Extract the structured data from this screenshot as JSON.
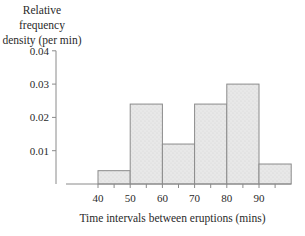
{
  "chart_data": {
    "type": "bar",
    "subtype": "histogram",
    "title": "",
    "ylabel": "Relative frequency density (per min)",
    "ylabel_lines": [
      "Relative frequency",
      "density (per min)"
    ],
    "xlabel": "Time intervals between eruptions (mins)",
    "ylim": [
      0,
      0.04
    ],
    "y_ticks": [
      "0.01",
      "0.02",
      "0.03",
      "0.04"
    ],
    "y_tick_values": [
      0.01,
      0.02,
      0.03,
      0.04
    ],
    "x_ticks": [
      "40",
      "50",
      "60",
      "70",
      "80",
      "90"
    ],
    "x_tick_values": [
      40,
      50,
      60,
      70,
      80,
      90
    ],
    "bins": [
      {
        "from": 40,
        "to": 50,
        "value": 0.004
      },
      {
        "from": 50,
        "to": 60,
        "value": 0.024
      },
      {
        "from": 60,
        "to": 70,
        "value": 0.012
      },
      {
        "from": 70,
        "to": 80,
        "value": 0.024
      },
      {
        "from": 80,
        "to": 90,
        "value": 0.03
      },
      {
        "from": 90,
        "to": 100,
        "value": 0.006
      }
    ],
    "categories": [
      "40-50",
      "50-60",
      "60-70",
      "70-80",
      "80-90",
      "90-100"
    ],
    "values": [
      0.004,
      0.024,
      0.012,
      0.024,
      0.03,
      0.006
    ],
    "grid": false,
    "legend": null,
    "bar_color": "#e6e6e6",
    "bar_edge_color": "#8a8a8a"
  }
}
